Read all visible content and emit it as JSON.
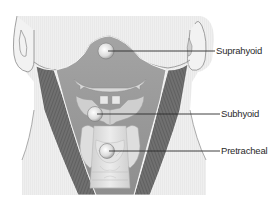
{
  "figure": {
    "colors": {
      "skin": "#ececec",
      "skin_outline": "#8a8a8a",
      "region_fill": "#9a9a9a",
      "muscle": "#6e6e6e",
      "cartilage": "#d6d6d6",
      "node": "#e2e2e2",
      "leader_line": "#2a2a2a",
      "text": "#2a2a2a"
    },
    "labels": [
      {
        "id": "suprahyoid",
        "text": "Suprahyoid",
        "node_x": 106,
        "node_y": 51,
        "label_x": 215,
        "label_y": 51
      },
      {
        "id": "subhyoid",
        "text": "Subhyoid",
        "node_x": 95,
        "node_y": 114,
        "label_x": 220,
        "label_y": 114
      },
      {
        "id": "pretracheal",
        "text": "Pretracheal",
        "node_x": 107,
        "node_y": 151,
        "label_x": 220,
        "label_y": 151
      }
    ]
  }
}
